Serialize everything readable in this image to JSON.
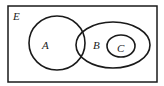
{
  "diagram": {
    "type": "venn",
    "universe": {
      "label": "E",
      "x": 8,
      "y": 6,
      "width": 149,
      "height": 76
    },
    "sets": [
      {
        "id": "A",
        "label": "A",
        "cx": 57,
        "cy": 43,
        "rx": 28,
        "ry": 27,
        "label_x": 42,
        "label_y": 49
      },
      {
        "id": "B",
        "label": "B",
        "cx": 113,
        "cy": 45,
        "rx": 37,
        "ry": 23,
        "label_x": 93,
        "label_y": 49
      },
      {
        "id": "C",
        "label": "C",
        "cx": 121,
        "cy": 46,
        "rx": 14,
        "ry": 11,
        "label_x": 117,
        "label_y": 52
      }
    ],
    "relations": [
      "A intersects B",
      "C is a subset of B",
      "A and C are disjoint"
    ],
    "colors": {
      "stroke": "#1a1a1a",
      "background": "#ffffff",
      "text": "#222222"
    }
  }
}
